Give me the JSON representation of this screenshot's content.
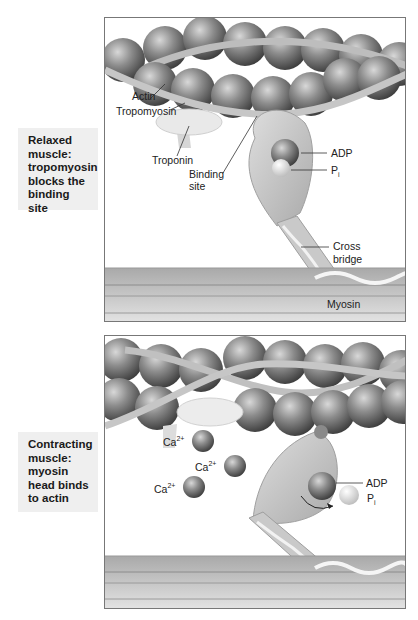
{
  "panels": [
    {
      "caption": [
        "Relaxed",
        "muscle:",
        "tropomyosin",
        "blocks the",
        "binding site"
      ],
      "labels": {
        "actin": "Actin",
        "tropomyosin": "Tropomyosin",
        "troponin": "Troponin",
        "binding_site_1": "Binding",
        "binding_site_2": "site",
        "adp": "ADP",
        "pi_main": "P",
        "pi_sub": "i",
        "cross_bridge_1": "Cross",
        "cross_bridge_2": "bridge",
        "myosin": "Myosin"
      }
    },
    {
      "caption": [
        "Contracting",
        "muscle:",
        "myosin",
        "head binds",
        "to actin"
      ],
      "labels": {
        "ca_main": "Ca",
        "ca_sup": "2+",
        "adp": "ADP",
        "pi_main": "P",
        "pi_sub": "i"
      }
    }
  ],
  "colors": {
    "actin_bead": "#8a8a8a",
    "tropomyosin": "#c4c4c4",
    "troponin": "#e6e6e6",
    "myosin_head": "#c8c8c8",
    "myosin_band": "#b0b0b0",
    "caption_bg": "#efefef"
  }
}
